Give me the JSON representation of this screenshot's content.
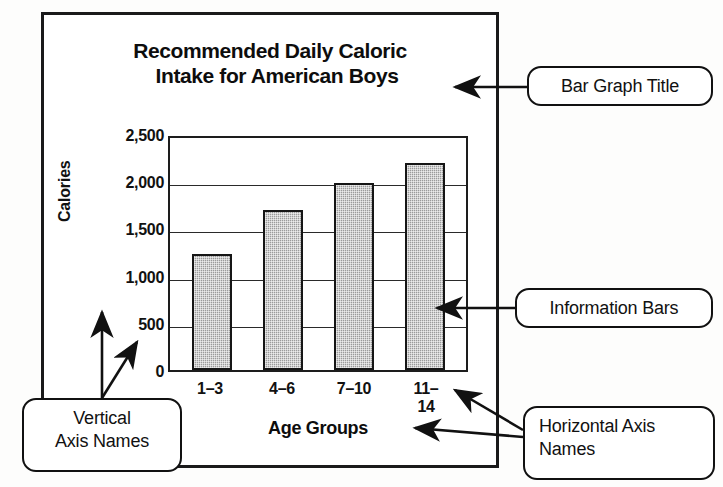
{
  "chart_data": {
    "type": "bar",
    "title": "Recommended Daily Caloric Intake for American Boys",
    "title_line1": "Recommended Daily Caloric",
    "title_line2": "Intake for American Boys",
    "categories": [
      "1–3",
      "4–6",
      "7–10",
      "11–14"
    ],
    "values": [
      1230,
      1700,
      1980,
      2190
    ],
    "xlabel": "Age Groups",
    "ylabel": "Calories",
    "ylim": [
      0,
      2500
    ],
    "ytick_labels": [
      "2,500",
      "2,000",
      "1,500",
      "1,000",
      "500",
      "0"
    ],
    "ytick_values": [
      2500,
      2000,
      1500,
      1000,
      500,
      0
    ],
    "grid": true,
    "legend": "none",
    "bar_fill_color": "#9b9b9b",
    "bar_border_color": "#161616",
    "axis_color": "#1d1d1d"
  },
  "annotations": {
    "title_callout": "Bar Graph Title",
    "bars_callout": "Information Bars",
    "vertical_axis_callout_line1": "Vertical",
    "vertical_axis_callout_line2": "Axis Names",
    "horizontal_axis_callout_line1": "Horizontal Axis",
    "horizontal_axis_callout_line2": "Names"
  }
}
